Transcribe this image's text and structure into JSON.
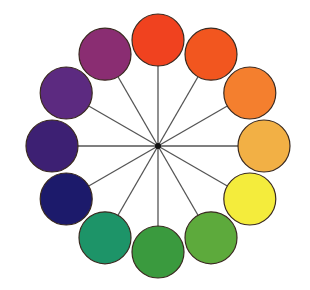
{
  "diagram": {
    "type": "color-wheel",
    "center": {
      "x": 158,
      "y": 146
    },
    "radius": 106,
    "circle_radius": 26,
    "spoke_color": "#555555",
    "hub_color": "#111111",
    "outline_color": "#3a2a20",
    "segments": [
      {
        "name": "red-orange",
        "color": "#f0421f",
        "angle": -90
      },
      {
        "name": "orange-red",
        "color": "#f2561f",
        "angle": -60
      },
      {
        "name": "orange",
        "color": "#f47f2e",
        "angle": -30
      },
      {
        "name": "yellow-orange",
        "color": "#f2b045",
        "angle": 0
      },
      {
        "name": "yellow",
        "color": "#f4ec3c",
        "angle": 30
      },
      {
        "name": "yellow-green",
        "color": "#5daa3c",
        "angle": 60
      },
      {
        "name": "green",
        "color": "#3a9a3e",
        "angle": 90
      },
      {
        "name": "blue-green",
        "color": "#1d9468",
        "angle": 120
      },
      {
        "name": "blue",
        "color": "#1c1a6b",
        "angle": 150
      },
      {
        "name": "blue-violet",
        "color": "#3d2073",
        "angle": 180
      },
      {
        "name": "violet",
        "color": "#5c2a80",
        "angle": 210
      },
      {
        "name": "red-violet",
        "color": "#8a2d72",
        "angle": 240
      }
    ]
  }
}
